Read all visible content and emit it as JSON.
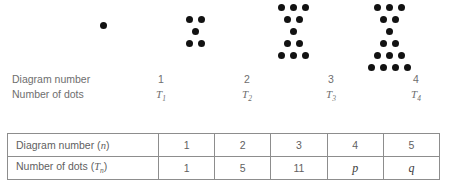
{
  "diagrams": [
    {
      "name": "diagram-1",
      "left": 100,
      "dot_count": 1,
      "rows": [
        [
          0
        ]
      ],
      "row_spacing": 12,
      "col_spacing": 12,
      "top_offset": 22,
      "clipped_top": false
    },
    {
      "name": "diagram-2",
      "left": 186,
      "dot_count": 5,
      "rows": [
        [
          0,
          2
        ],
        [
          1
        ],
        [
          0,
          2
        ]
      ],
      "row_spacing": 12,
      "col_spacing": 12,
      "top_offset": 16,
      "clipped_top": false
    },
    {
      "name": "diagram-3",
      "left": 278,
      "dot_count": 11,
      "rows": [
        [
          0,
          2,
          4
        ],
        [
          1,
          3
        ],
        [
          2
        ],
        [
          1,
          3
        ],
        [
          0,
          2,
          4
        ]
      ],
      "row_spacing": 12,
      "col_spacing": 12,
      "top_offset": 4,
      "clipped_top": false
    },
    {
      "name": "diagram-4",
      "left": 368,
      "dot_count": 19,
      "rows": [
        [
          0,
          2,
          4,
          6
        ],
        [
          1,
          3,
          5
        ],
        [
          2,
          4
        ],
        [
          3
        ],
        [
          2,
          4
        ],
        [
          1,
          3,
          5
        ],
        [
          0,
          2,
          4,
          6
        ]
      ],
      "row_spacing": 12,
      "col_spacing": 12,
      "top_offset": -8,
      "clipped_top": true
    }
  ],
  "caption_rows": {
    "diagram_number": {
      "title": "Diagram number",
      "values": [
        "1",
        "2",
        "3",
        "4"
      ]
    },
    "number_of_dots": {
      "title": "Number of dots",
      "symbol": "T",
      "subscripts": [
        "1",
        "2",
        "3",
        "4"
      ]
    }
  },
  "table": {
    "rows": [
      {
        "header_text": "Diagram number (",
        "header_var": "n",
        "header_sub": "",
        "header_close": ")",
        "cells": [
          "1",
          "2",
          "3",
          "4",
          "5"
        ],
        "italic_cells": [
          false,
          false,
          false,
          false,
          false
        ]
      },
      {
        "header_text": "Number of dots (",
        "header_var": "T",
        "header_sub": "n",
        "header_close": ")",
        "cells": [
          "1",
          "5",
          "11",
          "p",
          "q"
        ],
        "italic_cells": [
          false,
          false,
          false,
          true,
          true
        ]
      }
    ]
  },
  "colors": {
    "dot": "#121212",
    "text": "#6e6e6e",
    "table_border": "#8d8d8d",
    "background": "#ffffff"
  }
}
